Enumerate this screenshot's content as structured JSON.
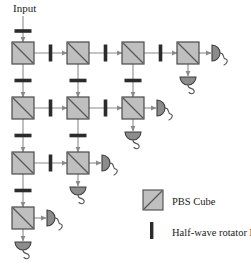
{
  "figure": {
    "input_label": "Input",
    "colors": {
      "cube_fill": "#bfbfbf",
      "cube_stroke": "#4a4a4a",
      "cube_diagonal": "#595959",
      "rotator_fill": "#2b2b2b",
      "beam_line": "#8a8a8a",
      "detector_fill": "#8c8c8c",
      "detector_stroke": "#3d3d3d",
      "wire": "#555555",
      "text": "#1a1a1a",
      "background": "#ffffff"
    },
    "geometry": {
      "cube_size": 22,
      "col_x": [
        12,
        67,
        122,
        177
      ],
      "row_y": [
        42,
        97,
        152,
        207
      ]
    }
  },
  "legend": {
    "items": [
      {
        "symbol": "pbs-cube",
        "label": "PBS Cube"
      },
      {
        "symbol": "half-wave-rotator",
        "label": "Half-wave rotator R",
        "subscript": "45"
      }
    ]
  },
  "network": {
    "rows": [
      {
        "row": 1,
        "cube_count": 4,
        "cubes_at_cols": [
          1,
          2,
          3,
          4
        ]
      },
      {
        "row": 2,
        "cube_count": 3,
        "cubes_at_cols": [
          1,
          2,
          3
        ]
      },
      {
        "row": 3,
        "cube_count": 2,
        "cubes_at_cols": [
          1,
          2
        ]
      },
      {
        "row": 4,
        "cube_count": 1,
        "cubes_at_cols": [
          1
        ]
      }
    ],
    "cubes": [
      {
        "id": "pbs-r1c1",
        "col": 1,
        "row": 1
      },
      {
        "id": "pbs-r1c2",
        "col": 2,
        "row": 1
      },
      {
        "id": "pbs-r1c3",
        "col": 3,
        "row": 1
      },
      {
        "id": "pbs-r1c4",
        "col": 4,
        "row": 1
      },
      {
        "id": "pbs-r2c1",
        "col": 1,
        "row": 2
      },
      {
        "id": "pbs-r2c2",
        "col": 2,
        "row": 2
      },
      {
        "id": "pbs-r2c3",
        "col": 3,
        "row": 2
      },
      {
        "id": "pbs-r3c1",
        "col": 1,
        "row": 3
      },
      {
        "id": "pbs-r3c2",
        "col": 2,
        "row": 3
      },
      {
        "id": "pbs-r4c1",
        "col": 1,
        "row": 4
      }
    ],
    "horizontal_rotators": [
      {
        "id": "hwr-r1-c1c2",
        "row": 1,
        "between_cols": [
          1,
          2
        ]
      },
      {
        "id": "hwr-r1-c2c3",
        "row": 1,
        "between_cols": [
          2,
          3
        ]
      },
      {
        "id": "hwr-r1-c3c4",
        "row": 1,
        "between_cols": [
          3,
          4
        ]
      },
      {
        "id": "hwr-r2-c1c2",
        "row": 2,
        "between_cols": [
          1,
          2
        ]
      },
      {
        "id": "hwr-r2-c2c3",
        "row": 2,
        "between_cols": [
          2,
          3
        ]
      },
      {
        "id": "hwr-r3-c1c2",
        "row": 3,
        "between_cols": [
          1,
          2
        ]
      }
    ],
    "vertical_rotators": [
      {
        "id": "hwr-input-c1",
        "col": 1,
        "above_row": 1
      },
      {
        "id": "hwr-c1-r1r2",
        "col": 1,
        "between_rows": [
          1,
          2
        ]
      },
      {
        "id": "hwr-c2-r1r2",
        "col": 2,
        "between_rows": [
          1,
          2
        ]
      },
      {
        "id": "hwr-c3-r1r2",
        "col": 3,
        "between_rows": [
          1,
          2
        ]
      },
      {
        "id": "hwr-c1-r2r3",
        "col": 1,
        "between_rows": [
          2,
          3
        ]
      },
      {
        "id": "hwr-c2-r2r3",
        "col": 2,
        "between_rows": [
          2,
          3
        ]
      },
      {
        "id": "hwr-c1-r3r4",
        "col": 1,
        "between_rows": [
          3,
          4
        ]
      }
    ],
    "detectors": [
      {
        "id": "detector-r1c4-right",
        "orientation": "right",
        "col": 4,
        "row": 1
      },
      {
        "id": "detector-r1c4-down",
        "orientation": "down",
        "col": 4,
        "row": 1
      },
      {
        "id": "detector-r2c3-right",
        "orientation": "right",
        "col": 3,
        "row": 2
      },
      {
        "id": "detector-r2c3-down",
        "orientation": "down",
        "col": 3,
        "row": 2
      },
      {
        "id": "detector-r3c2-right",
        "orientation": "right",
        "col": 2,
        "row": 3
      },
      {
        "id": "detector-r3c2-down",
        "orientation": "down",
        "col": 2,
        "row": 3
      },
      {
        "id": "detector-r4c1-right",
        "orientation": "right",
        "col": 1,
        "row": 4
      },
      {
        "id": "detector-r4c1-down",
        "orientation": "down",
        "col": 1,
        "row": 4
      }
    ]
  }
}
